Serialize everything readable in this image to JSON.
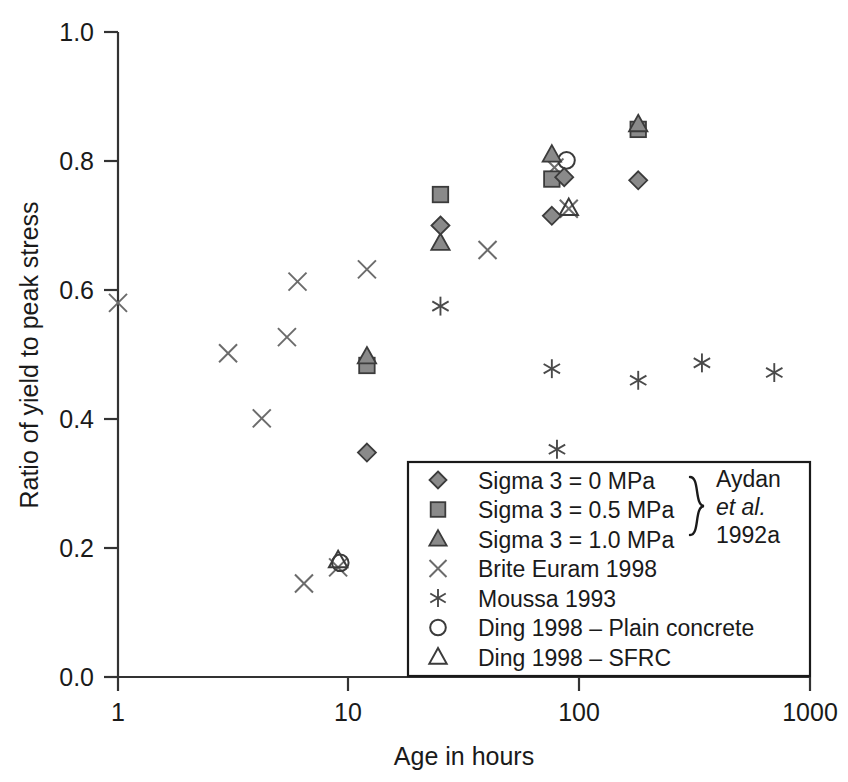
{
  "chart_data": {
    "type": "scatter",
    "title": "",
    "xlabel": "Age in hours",
    "ylabel": "Ratio of yield to peak stress",
    "xscale": "log",
    "xlim": [
      1,
      1000
    ],
    "ylim": [
      0.0,
      1.0
    ],
    "xticks": [
      "1",
      "10",
      "100",
      "1000"
    ],
    "xtick_values": [
      1,
      10,
      100,
      1000
    ],
    "yticks": [
      "0.0",
      "0.2",
      "0.4",
      "0.6",
      "0.8",
      "1.0"
    ],
    "ytick_values": [
      0.0,
      0.2,
      0.4,
      0.6,
      0.8,
      1.0
    ],
    "grid": false,
    "legend_position": "bottom-right",
    "series": [
      {
        "name": "Sigma 3 = 0 MPa",
        "marker": "diamond-filled",
        "points": [
          {
            "x": 12,
            "y": 0.348
          },
          {
            "x": 25,
            "y": 0.7
          },
          {
            "x": 76,
            "y": 0.715
          },
          {
            "x": 86,
            "y": 0.775
          },
          {
            "x": 180,
            "y": 0.77
          }
        ]
      },
      {
        "name": "Sigma 3 = 0.5 MPa",
        "marker": "square-filled",
        "points": [
          {
            "x": 12,
            "y": 0.483
          },
          {
            "x": 25,
            "y": 0.748
          },
          {
            "x": 76,
            "y": 0.772
          },
          {
            "x": 180,
            "y": 0.849
          }
        ]
      },
      {
        "name": "Sigma 3 = 1.0 MPa",
        "marker": "triangle-filled",
        "points": [
          {
            "x": 12,
            "y": 0.497
          },
          {
            "x": 25,
            "y": 0.673
          },
          {
            "x": 76,
            "y": 0.81
          },
          {
            "x": 180,
            "y": 0.857
          }
        ]
      },
      {
        "name": "Brite Euram 1998",
        "marker": "cross",
        "points": [
          {
            "x": 1.0,
            "y": 0.58
          },
          {
            "x": 3.0,
            "y": 0.502
          },
          {
            "x": 4.2,
            "y": 0.401
          },
          {
            "x": 5.4,
            "y": 0.527
          },
          {
            "x": 6.0,
            "y": 0.613
          },
          {
            "x": 6.4,
            "y": 0.145
          },
          {
            "x": 9.0,
            "y": 0.17
          },
          {
            "x": 12.0,
            "y": 0.632
          },
          {
            "x": 40.0,
            "y": 0.662
          },
          {
            "x": 78.0,
            "y": 0.79
          },
          {
            "x": 90.0,
            "y": 0.726
          }
        ]
      },
      {
        "name": "Moussa 1993",
        "marker": "asterisk",
        "points": [
          {
            "x": 25,
            "y": 0.575
          },
          {
            "x": 76,
            "y": 0.478
          },
          {
            "x": 80,
            "y": 0.353
          },
          {
            "x": 180,
            "y": 0.46
          },
          {
            "x": 340,
            "y": 0.487
          },
          {
            "x": 700,
            "y": 0.472
          }
        ]
      },
      {
        "name": "Ding 1998 – Plain concrete",
        "marker": "circle-open",
        "points": [
          {
            "x": 9.2,
            "y": 0.177
          },
          {
            "x": 88,
            "y": 0.801
          }
        ]
      },
      {
        "name": "Ding 1998 – SFRC",
        "marker": "triangle-open",
        "points": [
          {
            "x": 9.0,
            "y": 0.181
          },
          {
            "x": 90,
            "y": 0.727
          }
        ]
      }
    ],
    "legend": {
      "entries": [
        {
          "label": "Sigma 3 = 0 MPa",
          "marker": "diamond-filled"
        },
        {
          "label": "Sigma 3 = 0.5 MPa",
          "marker": "square-filled"
        },
        {
          "label": "Sigma 3 = 1.0 MPa",
          "marker": "triangle-filled"
        },
        {
          "label": "Brite Euram 1998",
          "marker": "cross"
        },
        {
          "label": "Moussa 1993",
          "marker": "asterisk"
        },
        {
          "label": "Ding 1998 – Plain concrete",
          "marker": "circle-open"
        },
        {
          "label": "Ding 1998 – SFRC",
          "marker": "triangle-open"
        }
      ],
      "brace_group": {
        "line1": "Aydan",
        "line2": "et al.",
        "line3": "1992a"
      }
    },
    "colors": {
      "marker_fill": "#8a8a8a",
      "marker_stroke": "#3b3b3b",
      "axis": "#333333",
      "text": "#1a1a1a",
      "background": "#ffffff"
    }
  }
}
